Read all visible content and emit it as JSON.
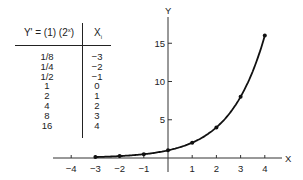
{
  "table": {
    "header_left_main": "Y' = (1) (2",
    "header_left_sup": "x",
    "header_left_close": ")",
    "header_right": "Xi",
    "rows": [
      {
        "y": "1/8",
        "x": "−3"
      },
      {
        "y": "1/4",
        "x": "−2"
      },
      {
        "y": "1/2",
        "x": "−1"
      },
      {
        "y": "1",
        "x": "0"
      },
      {
        "y": "2",
        "x": "1"
      },
      {
        "y": "4",
        "x": "2"
      },
      {
        "y": "8",
        "x": "3"
      },
      {
        "y": "16",
        "x": "4"
      }
    ]
  },
  "chart_data": {
    "type": "line",
    "title": "",
    "xlabel": "X",
    "ylabel": "Y",
    "x": [
      -3,
      -2,
      -1,
      0,
      1,
      2,
      3,
      4
    ],
    "series": [
      {
        "name": "Y' = (1)(2^x)",
        "values": [
          0.125,
          0.25,
          0.5,
          1,
          2,
          4,
          8,
          16
        ]
      }
    ],
    "x_ticks": [
      "−4",
      "−3",
      "−2",
      "−1",
      "1",
      "2",
      "3",
      "4"
    ],
    "y_ticks": [
      "5",
      "10",
      "15"
    ],
    "xlim": [
      -4.5,
      4.5
    ],
    "ylim": [
      0,
      18
    ],
    "grid": false,
    "legend": "none"
  }
}
